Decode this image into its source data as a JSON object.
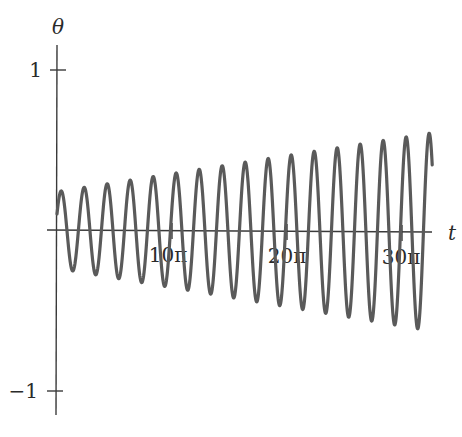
{
  "chart_data": {
    "type": "line",
    "title": "",
    "xlabel": "t",
    "ylabel": "θ",
    "x_ticks": [
      {
        "value": 31.4159,
        "label": "10π"
      },
      {
        "value": 62.8319,
        "label": "20π"
      },
      {
        "value": 94.2478,
        "label": "30π"
      }
    ],
    "y_ticks": [
      {
        "value": 1,
        "label": "1"
      },
      {
        "value": -1,
        "label": "−1"
      }
    ],
    "xlim": [
      0,
      102.5
    ],
    "ylim": [
      -1.05,
      1.15
    ],
    "grid": false,
    "legend": null,
    "series": [
      {
        "name": "θ(t)",
        "description": "Oscillation with period ≈ 2π and linearly growing amplitude",
        "function": "θ(t) = A(t)·sin(t + φ), A(t) ≈ 0.24 + 0.0037·t",
        "amplitude_start": 0.24,
        "amplitude_end": 0.62,
        "period": 6.2832,
        "theta_at_t0": 0.1,
        "t_end": 102.5,
        "theta_at_t_end": -0.53,
        "sample_peaks": [
          {
            "t": 1.57,
            "theta": 0.25
          },
          {
            "t": 32.99,
            "theta": 0.36
          },
          {
            "t": 64.4,
            "theta": 0.48
          },
          {
            "t": 95.82,
            "theta": 0.58
          }
        ],
        "sample_troughs": [
          {
            "t": 4.71,
            "theta": -0.26
          },
          {
            "t": 36.13,
            "theta": -0.37
          },
          {
            "t": 67.54,
            "theta": -0.49
          },
          {
            "t": 98.96,
            "theta": -0.67
          }
        ]
      }
    ],
    "style": {
      "line_color": "#5a5a5a",
      "axis_color": "#3a3a3a",
      "line_width": 3.2
    }
  }
}
